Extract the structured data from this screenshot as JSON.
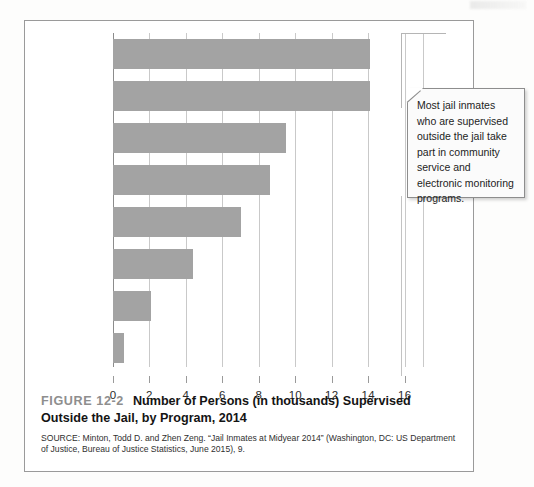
{
  "figure": {
    "number_label": "FIGURE 12-2",
    "title": "Number of Persons (in thousands) Supervised Outside the Jail, by Program, 2014",
    "source": "SOURCE: Minton, Todd D. and Zhen Zeng. “Jail Inmates at Midyear 2014” (Washington, DC: US Department of Justice, Bureau of Justice Statistics, June 2015), 9."
  },
  "callout": {
    "text": "Most jail inmates who are supervised outside the jail take part in community service and electronic monitoring programs."
  },
  "colors": {
    "bar": "#a3a3a3",
    "gridline": "#c9c9c9",
    "axis": "#8c8c8c",
    "frame": "#9a9a9a",
    "figure_number": "#8e8e8e"
  },
  "chart_data": {
    "type": "bar",
    "orientation": "horizontal",
    "title": "Number of Persons (in thousands) Supervised Outside the Jail, by Program, 2014",
    "xlabel": "",
    "ylabel": "",
    "categories": [
      "Community service",
      "Electronic monitoring",
      "Weekend",
      "Pretrial",
      "Other work",
      "Day reporting",
      "Treatment",
      "Home detention"
    ],
    "category_lines": [
      [
        "Community",
        "service"
      ],
      [
        "Electronic",
        "monitoring"
      ],
      [
        "Weekend"
      ],
      [
        "Pretrial"
      ],
      [
        "Other work"
      ],
      [
        "Day reporting"
      ],
      [
        "Treatment"
      ],
      [
        "Home detention"
      ]
    ],
    "values": [
      14.1,
      14.1,
      9.5,
      8.6,
      7.0,
      4.4,
      2.1,
      0.6
    ],
    "xlim": [
      0,
      17
    ],
    "xticks": [
      0,
      2,
      4,
      6,
      8,
      10,
      12,
      14,
      16
    ],
    "xtick_labels": [
      "0",
      "2",
      "4",
      "6",
      "8",
      "10",
      "12",
      "14",
      "16"
    ],
    "grid": true,
    "legend": false,
    "units": "thousands"
  }
}
